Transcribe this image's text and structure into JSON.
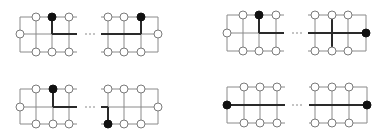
{
  "diagram": {
    "title": "",
    "colors": {
      "line": "#8a8a8a",
      "thick_line": "#2a2a2a",
      "open_node_stroke": "#7a7a7a",
      "filled_node": "#111111",
      "background": "#ffffff"
    },
    "node_radius": 4,
    "ellipsis": "· · ·",
    "panels": [
      {
        "id": "top-left",
        "top": 17,
        "mid": 34,
        "bottom": 52,
        "left_part": {
          "edge_x": 20,
          "line_end_x": 77,
          "verticals": [
            36,
            52,
            69
          ],
          "edge_node": "open",
          "top_nodes": [
            "open",
            "filled",
            "open"
          ],
          "bottom_nodes": [
            "open",
            "open",
            "open"
          ],
          "thick": [
            {
              "x1": 52,
              "y1": "top",
              "x2": 52,
              "y2": "mid"
            },
            {
              "x1": 52,
              "y1": "mid",
              "x2": 77,
              "y2": "mid"
            }
          ]
        },
        "dots_x": 90,
        "right_part": {
          "edge_x": 158,
          "line_start_x": 101,
          "verticals": [
            108,
            124,
            141
          ],
          "edge_node": "open",
          "top_nodes": [
            "open",
            "open",
            "filled"
          ],
          "bottom_nodes": [
            "open",
            "open",
            "open"
          ],
          "thick": [
            {
              "x1": 141,
              "y1": "top",
              "x2": 141,
              "y2": "mid"
            },
            {
              "x1": 101,
              "y1": "mid",
              "x2": 141,
              "y2": "mid"
            }
          ]
        }
      },
      {
        "id": "top-right",
        "top": 15,
        "mid": 33,
        "bottom": 51,
        "left_part": {
          "edge_x": 227,
          "line_end_x": 284,
          "verticals": [
            243,
            259,
            276
          ],
          "edge_node": "open",
          "top_nodes": [
            "open",
            "filled",
            "open"
          ],
          "bottom_nodes": [
            "open",
            "open",
            "open"
          ],
          "thick": [
            {
              "x1": 259,
              "y1": "top",
              "x2": 259,
              "y2": "mid"
            },
            {
              "x1": 259,
              "y1": "mid",
              "x2": 284,
              "y2": "mid"
            }
          ]
        },
        "dots_x": 297,
        "right_part": {
          "edge_x": 366,
          "line_start_x": 308,
          "verticals": [
            315,
            332,
            348
          ],
          "edge_node": "filled",
          "top_nodes": [
            "open",
            "open",
            "open"
          ],
          "bottom_nodes": [
            "open",
            "open",
            "open"
          ],
          "thick": [
            {
              "x1": 332,
              "y1": "top",
              "x2": 332,
              "y2": "bottom"
            },
            {
              "x1": 308,
              "y1": "mid",
              "x2": 366,
              "y2": "mid"
            }
          ]
        }
      },
      {
        "id": "bottom-left",
        "top": 89,
        "mid": 107,
        "bottom": 124,
        "left_part": {
          "edge_x": 20,
          "line_end_x": 77,
          "verticals": [
            36,
            53,
            69
          ],
          "edge_node": "open",
          "top_nodes": [
            "open",
            "filled",
            "open"
          ],
          "bottom_nodes": [
            "open",
            "open",
            "open"
          ],
          "thick": [
            {
              "x1": 53,
              "y1": "top",
              "x2": 53,
              "y2": "mid"
            },
            {
              "x1": 53,
              "y1": "mid",
              "x2": 77,
              "y2": "mid"
            }
          ]
        },
        "dots_x": 90,
        "right_part": {
          "edge_x": 158,
          "line_start_x": 101,
          "verticals": [
            108,
            124,
            141
          ],
          "edge_node": "open",
          "top_nodes": [
            "open",
            "open",
            "open"
          ],
          "bottom_nodes": [
            "filled",
            "open",
            "open"
          ],
          "thick": [
            {
              "x1": 108,
              "y1": "mid",
              "x2": 108,
              "y2": "bottom"
            },
            {
              "x1": 101,
              "y1": "mid",
              "x2": 108,
              "y2": "mid"
            }
          ]
        }
      },
      {
        "id": "bottom-right",
        "top": 87,
        "mid": 105,
        "bottom": 123,
        "left_part": {
          "edge_x": 227,
          "line_end_x": 285,
          "verticals": [
            244,
            260,
            277
          ],
          "edge_node": "filled",
          "top_nodes": [
            "open",
            "open",
            "open"
          ],
          "bottom_nodes": [
            "open",
            "open",
            "open"
          ],
          "thick": [
            {
              "x1": 227,
              "y1": "mid",
              "x2": 285,
              "y2": "mid"
            }
          ]
        },
        "dots_x": 297,
        "right_part": {
          "edge_x": 367,
          "line_start_x": 309,
          "verticals": [
            315,
            332,
            349
          ],
          "edge_node": "filled",
          "top_nodes": [
            "open",
            "open",
            "open"
          ],
          "bottom_nodes": [
            "open",
            "open",
            "open"
          ],
          "thick": [
            {
              "x1": 309,
              "y1": "mid",
              "x2": 367,
              "y2": "mid"
            }
          ]
        }
      }
    ]
  }
}
